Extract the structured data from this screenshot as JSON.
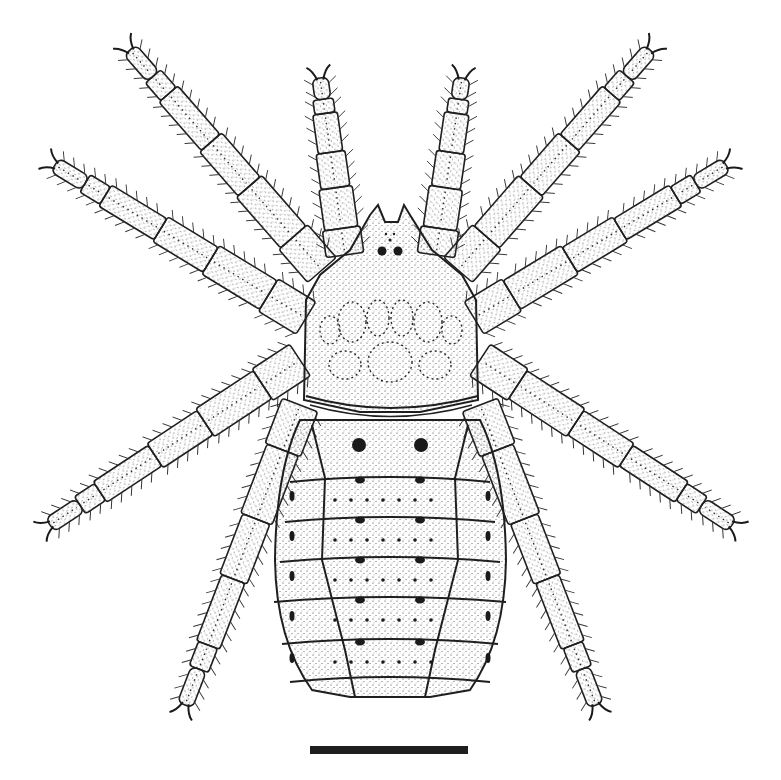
{
  "figure": {
    "style": "stippled ink drawing",
    "colors": {
      "ink": "#1f1f1f",
      "background": "#ffffff",
      "stipple": "#3a3a3a"
    },
    "legs": [
      {
        "side": "left",
        "pair": 1,
        "tip": [
          130,
          50
        ],
        "base": [
          322,
          270
        ]
      },
      {
        "side": "left",
        "pair": 2,
        "tip": [
          55,
          165
        ],
        "base": [
          306,
          318
        ]
      },
      {
        "side": "left",
        "pair": 3,
        "tip": [
          50,
          525
        ],
        "base": [
          300,
          360
        ]
      },
      {
        "side": "left",
        "pair": 4,
        "tip": [
          185,
          705
        ],
        "base": [
          300,
          405
        ]
      },
      {
        "side": "right",
        "pair": 1,
        "tip": [
          650,
          50
        ],
        "base": [
          458,
          270
        ]
      },
      {
        "side": "right",
        "pair": 2,
        "tip": [
          726,
          165
        ],
        "base": [
          474,
          318
        ]
      },
      {
        "side": "right",
        "pair": 3,
        "tip": [
          732,
          525
        ],
        "base": [
          480,
          360
        ]
      },
      {
        "side": "right",
        "pair": 4,
        "tip": [
          596,
          705
        ],
        "base": [
          480,
          405
        ]
      },
      {
        "side": "left",
        "pair": 0,
        "tip": [
          320,
          78
        ],
        "base": [
          345,
          255
        ]
      },
      {
        "side": "right",
        "pair": 0,
        "tip": [
          462,
          78
        ],
        "base": [
          436,
          255
        ]
      }
    ],
    "opisthosoma_segments": 7
  },
  "scale_bar": {
    "length_px": 158
  }
}
